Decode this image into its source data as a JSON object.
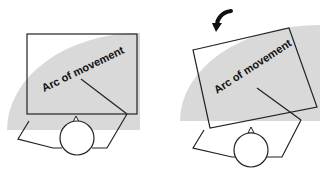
{
  "panels": [
    {
      "id": "before",
      "label": "Arc of movement",
      "arrow": false
    },
    {
      "id": "after",
      "label": "Arc of movement",
      "arrow": true
    }
  ],
  "colors": {
    "arc_fill": "#d9d9d9",
    "stroke": "#222222",
    "background": "#ffffff"
  }
}
